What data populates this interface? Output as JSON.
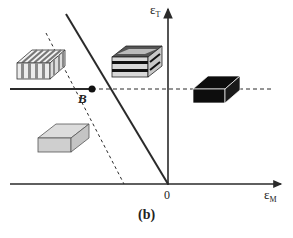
{
  "figure": {
    "caption": "(b)",
    "axes": {
      "y_axis": {
        "symbol": "ε",
        "subscript": "T"
      },
      "x_axis": {
        "symbol": "ε",
        "subscript": "M"
      },
      "origin_label": "0"
    },
    "points": [
      {
        "id": "B",
        "label": "B"
      }
    ],
    "lines": [
      {
        "id": "solid-diagonal",
        "style": "solid",
        "description": "steep line through B to origin"
      },
      {
        "id": "solid-horizontal",
        "style": "solid",
        "description": "horizontal line ending at B"
      },
      {
        "id": "dashed-horizontal",
        "style": "dashed",
        "description": "horizontal continuation from B to right"
      },
      {
        "id": "dashed-diagonal",
        "style": "dashed",
        "description": "diagonal through B reaching ε_M axis"
      }
    ],
    "regions": [
      {
        "id": "upper-left",
        "glyph": "vertically-striped-block"
      },
      {
        "id": "upper-middle",
        "glyph": "horizontally-layered-block"
      },
      {
        "id": "right",
        "glyph": "solid-black-block"
      },
      {
        "id": "lower-left",
        "glyph": "gray-block"
      }
    ],
    "colors": {
      "line": "#2a2a2a",
      "black_block": "#0d0d0d",
      "gray_block": "#cfcfcf",
      "gray_block_top": "#dcdcdc",
      "stripe_light": "#e6e6e6",
      "stripe_dark": "#8a8a8a"
    }
  }
}
